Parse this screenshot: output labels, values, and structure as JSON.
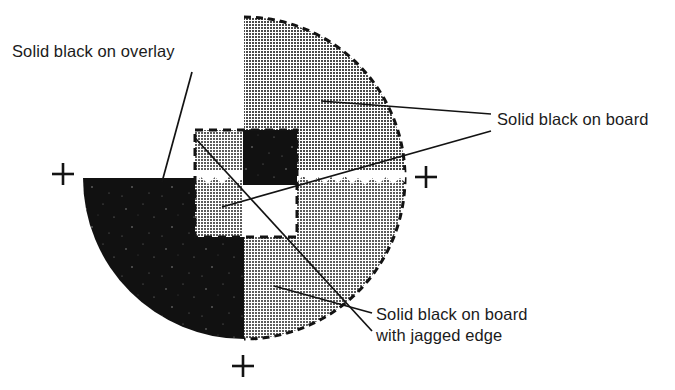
{
  "figure": {
    "kind": "prepress-registration-test-target",
    "background_color": "#ffffff",
    "ink_color": "#131313",
    "halftone_gray": "#a8a8a8",
    "solid_black": "#111111",
    "paper_white": "#ffffff",
    "labels": [
      {
        "id": "solid-black-on-overlay",
        "lines": [
          "Solid black on overlay"
        ],
        "x": 12,
        "y": 57,
        "anchor": "start"
      },
      {
        "id": "solid-black-on-board",
        "lines": [
          "Solid black on board"
        ],
        "x": 497,
        "y": 125,
        "anchor": "start"
      },
      {
        "id": "solid-black-on-board-with-jagged-edge",
        "lines": [
          "Solid black on board",
          "with jagged edge"
        ],
        "x": 376,
        "y": 320,
        "anchor": "start"
      }
    ],
    "leader_lines": [
      {
        "id": "leader-overlay",
        "points": "192,72 162,182"
      },
      {
        "id": "leader-board-upper",
        "points": "491,114 321,101"
      },
      {
        "id": "leader-board-lower",
        "points": "491,131 222,207"
      },
      {
        "id": "leader-jagged-upper",
        "points": "372,313 274,286"
      },
      {
        "id": "leader-jagged-lower",
        "points": "372,331 196,139"
      }
    ],
    "circle": {
      "center_x": 244,
      "center_y": 178,
      "radius": 161,
      "quadrants": [
        {
          "id": "top-left",
          "fill": "paper-white",
          "edge": "none"
        },
        {
          "id": "top-right",
          "fill": "halftone-gray",
          "edge": "dashed-arc"
        },
        {
          "id": "bottom-left",
          "fill": "solid-black",
          "edge": "none"
        },
        {
          "id": "bottom-right",
          "fill": "halftone-gray",
          "edge": "dashed-arc"
        }
      ],
      "jagged_edge": {
        "present": true,
        "description": "ragged white break along the horizontal diameter of the lower-right quadrant"
      }
    },
    "overlay_box": {
      "id": "overlay-dashed-square",
      "x": 195,
      "y": 130,
      "width": 102,
      "height": 107,
      "border_style": "dashed",
      "border_color": "#131313",
      "border_width": 3,
      "cells": [
        {
          "id": "cell-top-left",
          "fill": "halftone-gray"
        },
        {
          "id": "cell-top-right",
          "fill": "solid-black"
        },
        {
          "id": "cell-bottom-left",
          "fill": "halftone-gray"
        },
        {
          "id": "cell-bottom-right",
          "fill": "paper-white"
        }
      ],
      "black_patch": {
        "x": 243,
        "y": 130,
        "width": 54,
        "height": 55
      }
    },
    "registration_marks": [
      {
        "id": "registration-mark-left",
        "x": 63,
        "y": 174,
        "size": 22
      },
      {
        "id": "registration-mark-right",
        "x": 426,
        "y": 177,
        "size": 22
      },
      {
        "id": "registration-mark-bottom",
        "x": 243,
        "y": 366,
        "size": 22
      }
    ]
  }
}
